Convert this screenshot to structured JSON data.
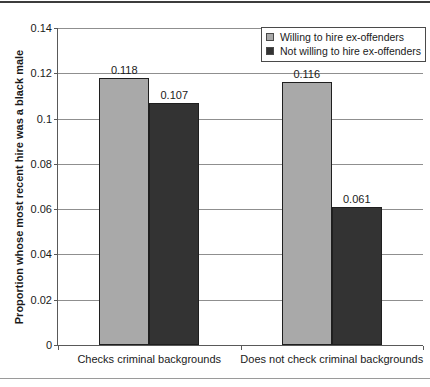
{
  "chart_data": {
    "type": "bar",
    "title": "",
    "categories": [
      "Checks criminal backgrounds",
      "Does not check criminal backgrounds"
    ],
    "series": [
      {
        "name": "Willing to hire ex-offenders",
        "color": "#a9a9a9",
        "values": [
          0.118,
          0.116
        ],
        "labels": [
          "0.118",
          "0.116"
        ]
      },
      {
        "name": "Not willing to hire ex-offenders",
        "color": "#333333",
        "values": [
          0.107,
          0.061
        ],
        "labels": [
          "0.107",
          "0.061"
        ]
      }
    ],
    "xlabel": "",
    "ylabel": "Proportion whose most recent hire was a black male",
    "ylim": [
      0,
      0.14
    ],
    "yticks": [
      "0.14",
      "0.12",
      "0.1",
      "0.08",
      "0.06",
      "0.04",
      "0.02",
      "0"
    ],
    "grid": "horizontal",
    "legend_position": "top-right",
    "colors": {
      "background": "#ffffff",
      "gridline": "#8f8f8f",
      "axis": "#595959",
      "text": "#1a1a1a",
      "bar_border": "#1f1f1f",
      "rule_top": "#3c3c3c",
      "rule_bottom": "#9a9a9a"
    }
  }
}
